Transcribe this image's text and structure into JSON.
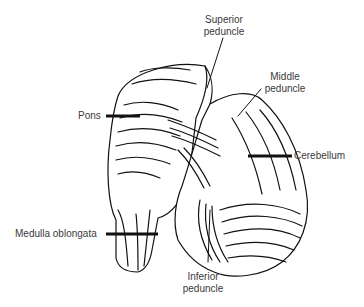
{
  "diagram": {
    "labels": {
      "superior_peduncle": [
        "Superior",
        "peduncle"
      ],
      "middle_peduncle": [
        "Middle",
        "peduncle"
      ],
      "pons": "Pons",
      "cerebellum": "Cerebellum",
      "medulla": "Medulla oblongata",
      "inferior_peduncle": [
        "Inferior",
        "peduncle"
      ]
    }
  }
}
